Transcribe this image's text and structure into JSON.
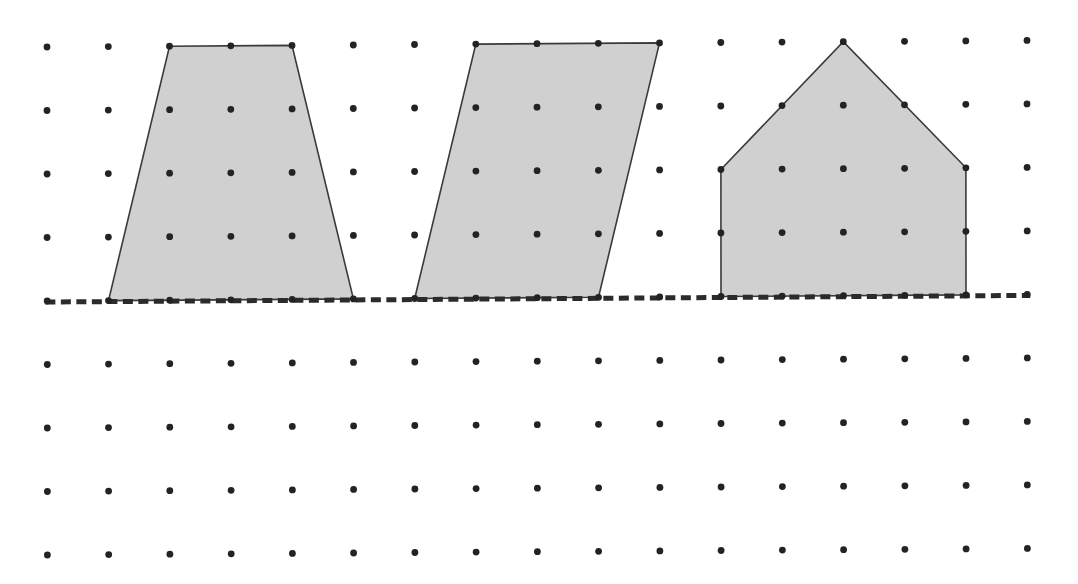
{
  "diagram": {
    "grid": {
      "columns": 17,
      "rows": 9,
      "origin": [
        47,
        47
      ],
      "col_step": [
        61.25,
        -0.41
      ],
      "row_step": [
        0.05,
        63.5
      ],
      "dot_radius": 3.4,
      "dot_color": "#232323"
    },
    "baseline": {
      "row": 4,
      "from_col": -0.03,
      "to_col": 16.05,
      "style": "dashed",
      "color": "#2b2b2b"
    },
    "fill_color": "#d0d0d0",
    "stroke_color": "#3a3a3a",
    "shapes": [
      {
        "name": "trapezoid",
        "type": "isosceles trapezoid",
        "vertices": [
          [
            2,
            0
          ],
          [
            4,
            0
          ],
          [
            5,
            4
          ],
          [
            1,
            4
          ]
        ]
      },
      {
        "name": "parallelogram",
        "type": "parallelogram",
        "vertices": [
          [
            7,
            0
          ],
          [
            10,
            0
          ],
          [
            9,
            4
          ],
          [
            6,
            4
          ]
        ]
      },
      {
        "name": "house-pentagon",
        "type": "pentagon",
        "vertices": [
          [
            11,
            2
          ],
          [
            13,
            0
          ],
          [
            15,
            2
          ],
          [
            15,
            4
          ],
          [
            11,
            4
          ]
        ]
      }
    ]
  }
}
